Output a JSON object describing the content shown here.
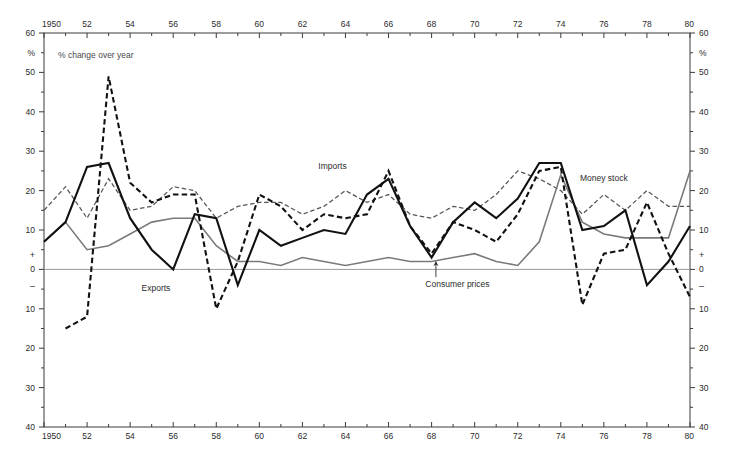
{
  "chart_data": {
    "type": "line",
    "title": "",
    "subtitle": "% change over year",
    "xlabel": "",
    "ylabel": "%",
    "ylim": [
      -40,
      60
    ],
    "xlim": [
      1950,
      1980
    ],
    "grid": false,
    "zero_line": true,
    "legend_position": "inline-annotations",
    "y_ticks": [
      60,
      50,
      40,
      30,
      20,
      10,
      0,
      -10,
      -20,
      -30,
      -40
    ],
    "y_tick_labels": [
      "60",
      "50",
      "40",
      "30",
      "20",
      "10",
      "0",
      "10",
      "20",
      "30",
      "40"
    ],
    "y_sign_labels": {
      "positive": "+",
      "negative": "–"
    },
    "unit_symbol": "%",
    "x_ticks": [
      1950,
      1952,
      1954,
      1956,
      1958,
      1960,
      1962,
      1964,
      1966,
      1968,
      1970,
      1972,
      1974,
      1976,
      1978,
      1980
    ],
    "x_tick_labels": [
      "1950",
      "52",
      "54",
      "56",
      "58",
      "60",
      "62",
      "64",
      "66",
      "68",
      "70",
      "72",
      "74",
      "76",
      "78",
      "80"
    ],
    "x_minor_interval": 1,
    "axis_top": true,
    "axis_bottom": true,
    "axis_left": true,
    "axis_right": true,
    "x": [
      1950,
      1951,
      1952,
      1953,
      1954,
      1955,
      1956,
      1957,
      1958,
      1959,
      1960,
      1961,
      1962,
      1963,
      1964,
      1965,
      1966,
      1967,
      1968,
      1969,
      1970,
      1971,
      1972,
      1973,
      1974,
      1975,
      1976,
      1977,
      1978,
      1979,
      1980
    ],
    "series": [
      {
        "name": "Exports",
        "style": "solid",
        "color": "#111111",
        "width": "thick",
        "label_x": 1955.2,
        "label_y": -5.5,
        "values": [
          7,
          12,
          26,
          27,
          13,
          5,
          0,
          14,
          13,
          -4,
          10,
          6,
          8,
          10,
          9,
          19,
          23,
          11,
          3,
          12,
          17,
          13,
          18,
          27,
          27,
          10,
          11,
          15,
          -4,
          2,
          11
        ]
      },
      {
        "name": "Imports",
        "style": "dashed",
        "color": "#111111",
        "width": "thick",
        "label_x": 1963.4,
        "label_y": 25.5,
        "values": [
          null,
          -15,
          -12,
          49,
          22,
          17,
          19,
          19,
          -10,
          2,
          19,
          16,
          10,
          14,
          13,
          14,
          25,
          11,
          4,
          12,
          10,
          7,
          14,
          25,
          26,
          -9,
          4,
          5,
          17,
          4,
          -7
        ]
      },
      {
        "name": "Money stock",
        "style": "dashed",
        "color": "#555555",
        "width": "thin",
        "label_x": 1976.0,
        "label_y": 22.5,
        "values": [
          15,
          21,
          13,
          23,
          15,
          16,
          21,
          20,
          13,
          16,
          17,
          17,
          14,
          16,
          20,
          17,
          19,
          14,
          13,
          16,
          15,
          19,
          25,
          23,
          20,
          14,
          19,
          15,
          20,
          16,
          16
        ]
      },
      {
        "name": "Consumer prices",
        "style": "solid",
        "color": "#7a7a7a",
        "width": "thin",
        "label_x": 1969.2,
        "label_y": -4.5,
        "label_pointer": true,
        "values": [
          7,
          12,
          5,
          6,
          9,
          12,
          13,
          13,
          6,
          2,
          2,
          1,
          3,
          2,
          1,
          2,
          3,
          2,
          2,
          3,
          4,
          2,
          1,
          7,
          24,
          12,
          9,
          8,
          8,
          8,
          25
        ]
      }
    ]
  }
}
